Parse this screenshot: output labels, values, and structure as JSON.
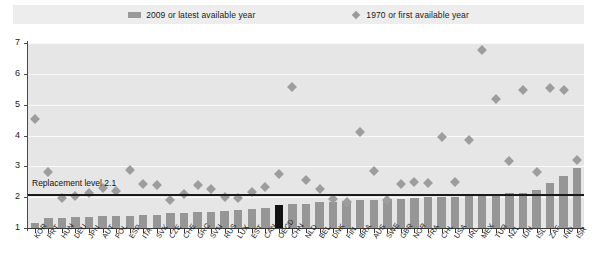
{
  "legend": {
    "items": [
      {
        "label": "2009 or latest available year",
        "marker": "bar-swatch-icon",
        "color": "#9a9a9a"
      },
      {
        "label": "1970 or first available year",
        "marker": "diamond-marker-icon",
        "color": "#9a9a9a"
      }
    ]
  },
  "annotation": {
    "replacement_label": "Replacement level 2.1",
    "replacement_value": 2.1
  },
  "colors": {
    "bar": "#969696",
    "bar_highlight": "#121212",
    "diamond": "#9d9d9d",
    "plot_background": "#e6e6e6",
    "legend_background": "#ededed",
    "gridline": "#fafafa",
    "axis": "#3a3a3a"
  },
  "chart_data": {
    "type": "bar",
    "title": "",
    "xlabel": "",
    "ylabel": "",
    "ylim": [
      1,
      7
    ],
    "yticks": [
      1,
      2,
      3,
      4,
      5,
      6,
      7
    ],
    "grid": true,
    "legend_position": "top",
    "highlight_category": "OECD",
    "categories": [
      "KOR",
      "PRT",
      "HUN",
      "DEU",
      "JPN",
      "AUT",
      "POL",
      "ESP",
      "ITA",
      "SVK",
      "CZE",
      "CHE",
      "GRC",
      "SVN",
      "RUS",
      "LUX",
      "EST",
      "CAN",
      "OECD",
      "CHN",
      "NLD",
      "BEL",
      "DNK",
      "FIN",
      "BRA",
      "AUS",
      "SWE",
      "GBR",
      "NOR",
      "FRA",
      "CHL",
      "USA",
      "IRL",
      "MEX",
      "TUR",
      "NZL",
      "IDN",
      "ISL",
      "ZAF",
      "IND",
      "ISR"
    ],
    "series": [
      {
        "name": "2009 or latest available year",
        "type": "bar",
        "values": [
          1.15,
          1.32,
          1.33,
          1.36,
          1.37,
          1.39,
          1.4,
          1.4,
          1.41,
          1.41,
          1.49,
          1.5,
          1.52,
          1.53,
          1.54,
          1.59,
          1.62,
          1.66,
          1.74,
          1.77,
          1.79,
          1.84,
          1.84,
          1.86,
          1.9,
          1.9,
          1.94,
          1.94,
          1.98,
          2.0,
          2.0,
          2.01,
          2.07,
          2.08,
          2.1,
          2.12,
          2.14,
          2.22,
          2.47,
          2.68,
          2.96
        ]
      },
      {
        "name": "1970 or first available year",
        "type": "scatter",
        "values": [
          4.53,
          2.83,
          1.98,
          2.03,
          2.13,
          2.29,
          2.2,
          2.88,
          2.42,
          2.41,
          1.92,
          2.1,
          2.4,
          2.25,
          2.0,
          1.97,
          2.16,
          2.33,
          2.74,
          5.57,
          2.57,
          2.25,
          1.95,
          1.83,
          4.1,
          2.86,
          1.92,
          2.43,
          2.5,
          2.47,
          3.95,
          2.48,
          3.87,
          6.78,
          5.17,
          3.17,
          5.48,
          2.81,
          5.55,
          5.49,
          3.2
        ]
      }
    ]
  }
}
